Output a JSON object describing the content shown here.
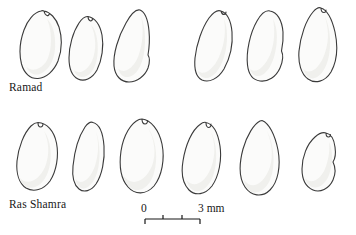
{
  "figure": {
    "type": "scientific-line-drawing",
    "background_color": "#ffffff",
    "outline_color": "#3a3a3a",
    "fill_color": "#fbfbfa",
    "shade_color": "#ededea"
  },
  "rows": [
    {
      "label": "Ramad",
      "specimen_count": 6,
      "groups": [
        {
          "specimens": [
            "seed-1",
            "seed-2",
            "seed-3"
          ]
        },
        {
          "specimens": [
            "seed-4",
            "seed-5",
            "seed-6"
          ]
        }
      ]
    },
    {
      "label": "Ras Shamra",
      "specimen_count": 6,
      "groups": [
        {
          "specimens": [
            "seed-7",
            "seed-8",
            "seed-9"
          ]
        },
        {
          "specimens": [
            "seed-10",
            "seed-11",
            "seed-12"
          ]
        }
      ]
    }
  ],
  "scale": {
    "min_label": "0",
    "max_label": "3 mm",
    "unit": "mm",
    "min_value": 0,
    "max_value": 3,
    "tick_count": 4,
    "tick_values": [
      0,
      1,
      2,
      3
    ]
  }
}
